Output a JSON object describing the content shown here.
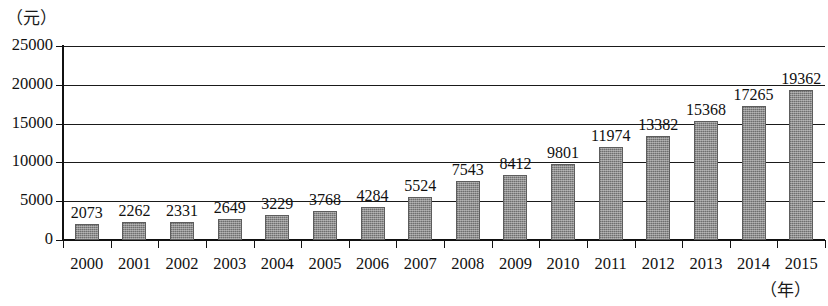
{
  "chart_data": {
    "type": "bar",
    "title": "",
    "subtitle": "",
    "xlabel": "（年）",
    "ylabel": "（元）",
    "categories": [
      "2000",
      "2001",
      "2002",
      "2003",
      "2004",
      "2005",
      "2006",
      "2007",
      "2008",
      "2009",
      "2010",
      "2011",
      "2012",
      "2013",
      "2014",
      "2015"
    ],
    "values": [
      2073,
      2262,
      2331,
      2649,
      3229,
      3768,
      4284,
      5524,
      7543,
      8412,
      9801,
      11974,
      13382,
      15368,
      17265,
      19362
    ],
    "value_labels": [
      "2073",
      "2262",
      "2331",
      "2649",
      "3229",
      "3768",
      "4284",
      "5524",
      "7543",
      "8412",
      "9801",
      "11974",
      "13382",
      "15368",
      "17265",
      "19362"
    ],
    "ylim": [
      0,
      25000
    ],
    "y_ticks": [
      0,
      5000,
      10000,
      15000,
      20000,
      25000
    ],
    "y_tick_labels": [
      "0",
      "5000",
      "10000",
      "15000",
      "20000",
      "25000"
    ],
    "grid": true,
    "grid_axis": "y",
    "legend": null,
    "legend_position": "none",
    "series": [
      {
        "name": "",
        "values": [
          2073,
          2262,
          2331,
          2649,
          3229,
          3768,
          4284,
          5524,
          7543,
          8412,
          9801,
          11974,
          13382,
          15368,
          17265,
          19362
        ],
        "color": "#8e8e8e"
      }
    ],
    "bar_color": "#8e8e8e",
    "bar_edge_color": "#5d5d5d",
    "axis_color": "#111111",
    "background_color": "#ffffff",
    "data_labels_shown": true
  }
}
